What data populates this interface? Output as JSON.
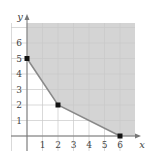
{
  "chart_data": {
    "type": "area",
    "title": "",
    "xlabel": "x",
    "ylabel": "y",
    "xlim": [
      -1,
      7
    ],
    "ylim": [
      -0.5,
      7
    ],
    "grid": true,
    "x_ticks": [
      "1",
      "2",
      "3",
      "4",
      "5",
      "6"
    ],
    "y_ticks": [
      "1",
      "2",
      "3",
      "4",
      "5",
      "6"
    ],
    "boundary": {
      "x": [
        0,
        2,
        6
      ],
      "y": [
        5,
        2,
        0
      ]
    },
    "vertices": [
      {
        "x": 0,
        "y": 5
      },
      {
        "x": 2,
        "y": 2
      },
      {
        "x": 6,
        "y": 0
      }
    ],
    "shaded_region": "feasible region above boundary, x >= 0, y >= 0 (unbounded)",
    "colors": {
      "shade": "#d4d4d4",
      "grid": "#c8c8c8",
      "boundary": "#8a8a8a",
      "axis": "#777777",
      "point": "#111111"
    }
  }
}
